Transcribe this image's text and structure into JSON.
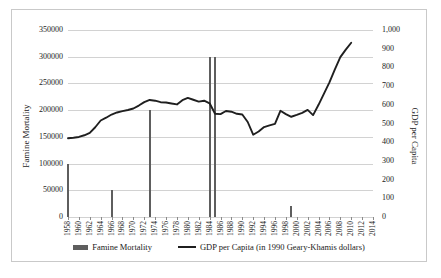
{
  "axis_titles": {
    "left": "Famine Mortality",
    "right": "GDP per Capita"
  },
  "legend": {
    "bar_label": "Famine Mortality",
    "line_label": "GDP per Capita (in 1990 Geary-Khamis dollars)"
  },
  "colors": {
    "bar": "#5e5e5e",
    "line": "#1f1f1f",
    "grid": "#d2d2d2",
    "frame": "#c9c9c9"
  },
  "chart_data": {
    "type": "bar",
    "title": "",
    "xlabel": "",
    "ylabel": "Famine Mortality",
    "y2label": "GDP per Capita",
    "grid": true,
    "legend_position": "bottom",
    "ylim": [
      0,
      350000
    ],
    "y2lim": [
      0,
      1000
    ],
    "yticks": [
      0,
      50000,
      100000,
      150000,
      200000,
      250000,
      300000,
      350000
    ],
    "ytick_labels": [
      "0",
      "50000",
      "100000",
      "150000",
      "200000",
      "250000",
      "300000",
      "350000"
    ],
    "y2ticks": [
      0,
      100,
      200,
      300,
      400,
      500,
      600,
      700,
      800,
      900,
      1000
    ],
    "y2tick_labels": [
      "0",
      "100",
      "200",
      "300",
      "400",
      "500",
      "600",
      "700",
      "800",
      "900",
      "1,000"
    ],
    "xlim": [
      1958,
      2014
    ],
    "xticks": [
      1958,
      1960,
      1962,
      1964,
      1966,
      1968,
      1970,
      1972,
      1974,
      1976,
      1978,
      1980,
      1982,
      1984,
      1986,
      1988,
      1990,
      1992,
      1994,
      1996,
      1998,
      2000,
      2002,
      2004,
      2006,
      2008,
      2010,
      2012,
      2014
    ],
    "xtick_labels": [
      "1958",
      "1960",
      "1962",
      "1964",
      "1966",
      "1968",
      "1970",
      "1972",
      "1974",
      "1976",
      "1978",
      "1980",
      "1982",
      "1984",
      "1986",
      "1988",
      "1990",
      "1992",
      "1994",
      "1996",
      "1998",
      "2000",
      "2002",
      "2004",
      "2006",
      "2008",
      "2010",
      "2012",
      "2014"
    ],
    "series": [
      {
        "name": "Famine Mortality",
        "kind": "bar",
        "axis": "left",
        "points": [
          {
            "x": 1958,
            "y": 100000
          },
          {
            "x": 1966,
            "y": 50000
          },
          {
            "x": 1973,
            "y": 200000
          },
          {
            "x": 1984,
            "y": 300000
          },
          {
            "x": 1985,
            "y": 300000
          },
          {
            "x": 1999,
            "y": 20000
          }
        ]
      },
      {
        "name": "GDP per Capita (in 1990 Geary-Khamis dollars)",
        "kind": "line",
        "axis": "right",
        "x": [
          1958,
          1959,
          1960,
          1961,
          1962,
          1963,
          1964,
          1965,
          1966,
          1967,
          1968,
          1969,
          1970,
          1971,
          1972,
          1973,
          1974,
          1975,
          1976,
          1977,
          1978,
          1979,
          1980,
          1981,
          1982,
          1983,
          1984,
          1985,
          1986,
          1987,
          1988,
          1989,
          1990,
          1991,
          1992,
          1993,
          1994,
          1995,
          1996,
          1997,
          1998,
          1999,
          2000,
          2001,
          2002,
          2003,
          2004,
          2005,
          2006,
          2007,
          2008,
          2009,
          2010
        ],
        "values": [
          421,
          424,
          428,
          437,
          450,
          480,
          516,
          531,
          548,
          559,
          566,
          572,
          580,
          596,
          614,
          626,
          622,
          614,
          612,
          607,
          602,
          625,
          637,
          627,
          617,
          622,
          608,
          552,
          550,
          567,
          563,
          552,
          548,
          508,
          440,
          457,
          481,
          490,
          498,
          568,
          550,
          536,
          546,
          557,
          573,
          545,
          600,
          660,
          720,
          790,
          855,
          895,
          932
        ]
      }
    ]
  }
}
